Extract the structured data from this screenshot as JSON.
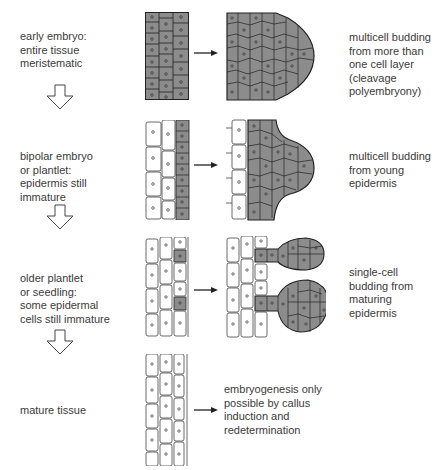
{
  "stages": [
    {
      "label": "early embryo:\nentire tissue\nmeristematic",
      "outcome": "multicell budding\nfrom more than\none cell layer\n(cleavage\npolyembryony)"
    },
    {
      "label": "bipolar embryo\nor plantlet:\nepidermis still\nimmature",
      "outcome": "multicell budding\nfrom young\nepidermis"
    },
    {
      "label": "older plantlet\nor seedling:\nsome epidermal\ncells still immature",
      "outcome": "single-cell\nbudding from\nmaturing\nepidermis"
    },
    {
      "label": "mature tissue",
      "outcome": "embryogenesis only\npossible by callus\ninduction and\nredetermination"
    }
  ],
  "icons": {
    "down_arrow": "hollow-down-arrow",
    "right_arrow": "right-arrow"
  },
  "colors": {
    "meristematic_cell": "#8c8c8c",
    "mature_cell": "#ffffff",
    "outline": "#2a2a2a"
  }
}
